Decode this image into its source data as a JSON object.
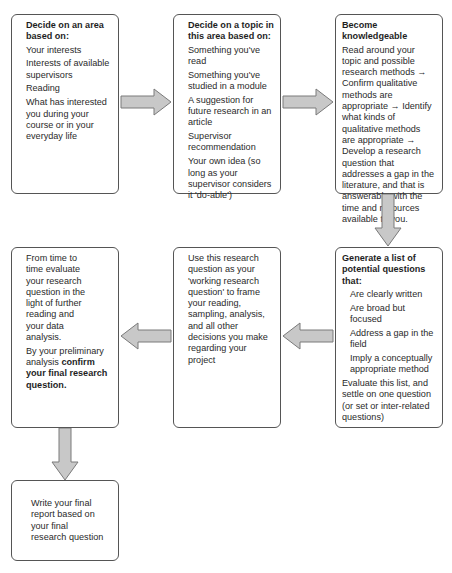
{
  "colors": {
    "box_border": "#555555",
    "arrow_fill": "#c8c8c8",
    "arrow_stroke": "#7a7a7a",
    "text": "#2a2a2a"
  },
  "boxes": {
    "area": {
      "title": "Decide on an area based on:",
      "items": [
        "Your interests",
        "Interests of available supervisors",
        "Reading",
        "What has interested you during your course or in your everyday life"
      ]
    },
    "topic": {
      "title": "Decide on a topic in this area based on:",
      "items": [
        "Something you've read",
        "Something you've studied in a module",
        "A suggestion for future research in an article",
        "Supervisor recommendation",
        "Your own idea (so long as your supervisor considers it 'do-able')"
      ]
    },
    "knowledgeable": {
      "title": "Become knowledgeable",
      "body": "Read around your topic and possible research methods → Confirm qualitative methods are appropriate → Identify what kinds of qualitative methods are appropriate → Develop a research question that addresses a gap in the literature, and that is answerable with the time and resources available to you."
    },
    "generate": {
      "title": "Generate a list of potential questions that:",
      "items": [
        "Are clearly written",
        "Are broad but focused",
        "Address a gap in the field",
        "Imply a conceptually appropriate method"
      ],
      "footer": "Evaluate this list, and settle on one question (or set or inter-related questions)"
    },
    "working": {
      "body": "Use this research question as your 'working research question' to frame your reading, sampling, analysis, and all other decisions you make regarding your project"
    },
    "evaluate": {
      "body": "From time to time evaluate your research question in the light of further reading and your data analysis.",
      "confirm_prefix": "By your preliminary analysis ",
      "confirm_bold": "confirm your final research question."
    },
    "report": {
      "body": "Write your final report based on your final research question"
    }
  }
}
